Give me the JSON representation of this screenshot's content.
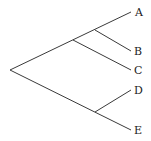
{
  "diagram": {
    "type": "phylogenetic-tree",
    "orientation": "left-to-right",
    "taxa": [
      {
        "id": "A",
        "label": "A"
      },
      {
        "id": "B",
        "label": "B"
      },
      {
        "id": "C",
        "label": "C"
      },
      {
        "id": "D",
        "label": "D"
      },
      {
        "id": "E",
        "label": "E"
      }
    ],
    "topology": "((((A,B),C),(D,E)))",
    "clades": [
      {
        "name": "AB",
        "members": [
          "A",
          "B"
        ]
      },
      {
        "name": "ABC",
        "members": [
          "A",
          "B",
          "C"
        ]
      },
      {
        "name": "DE",
        "members": [
          "D",
          "E"
        ]
      },
      {
        "name": "root",
        "members": [
          "A",
          "B",
          "C",
          "D",
          "E"
        ]
      }
    ],
    "line_color": "#3a3a3a",
    "background": "#ffffff"
  }
}
